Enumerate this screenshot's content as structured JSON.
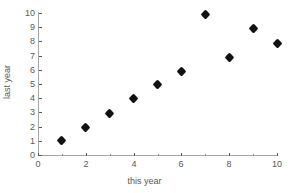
{
  "chart_data": {
    "type": "scatter",
    "title": "",
    "xlabel": "this year",
    "ylabel": "last year",
    "xlim": [
      0,
      10
    ],
    "ylim": [
      0,
      10
    ],
    "grid": false,
    "legend": null,
    "x_major_ticks": [
      0,
      2,
      4,
      6,
      8,
      10
    ],
    "x_minor_ticks": [
      1,
      3,
      5,
      7,
      9
    ],
    "y_major_ticks": [
      0,
      1,
      2,
      3,
      4,
      5,
      6,
      7,
      8,
      9,
      10
    ],
    "x_tick_labels": [
      "0",
      "2",
      "4",
      "6",
      "8",
      "10"
    ],
    "y_tick_labels": [
      "0",
      "1",
      "2",
      "3",
      "4",
      "5",
      "6",
      "7",
      "8",
      "9",
      "10"
    ],
    "series": [
      {
        "name": "points",
        "marker": "diamond",
        "color": "#111111",
        "x": [
          1,
          2,
          3,
          4,
          5,
          6,
          7,
          8,
          9,
          10
        ],
        "y": [
          1.0,
          1.95,
          2.95,
          3.95,
          4.95,
          5.9,
          9.9,
          6.9,
          8.9,
          7.85
        ]
      }
    ],
    "axis_color": "#a6a6a6",
    "text_color": "#595959",
    "background": "#ffffff"
  }
}
